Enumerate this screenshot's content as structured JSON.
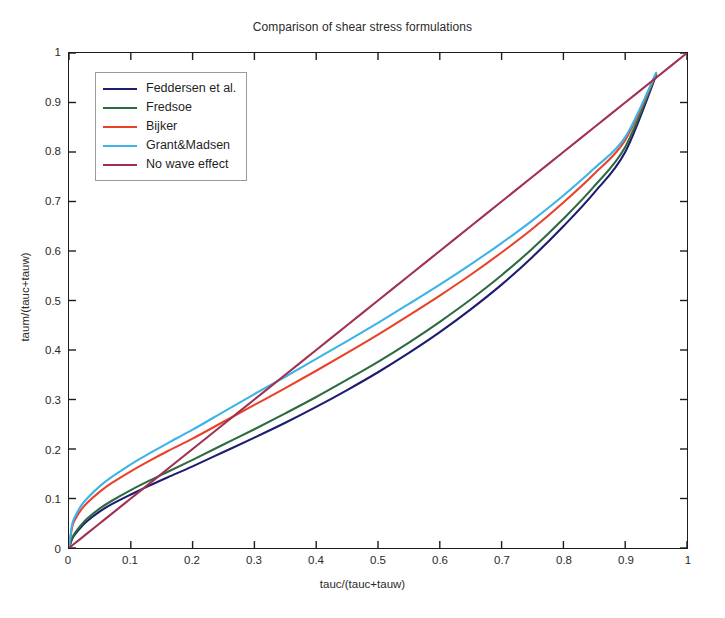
{
  "chart_data": {
    "type": "line",
    "title": "Comparison of shear stress formulations",
    "xlabel": "tauc/(tauc+tauw)",
    "ylabel": "taum/(tauc+tauw)",
    "xlim": [
      0,
      1
    ],
    "ylim": [
      0,
      1
    ],
    "grid": false,
    "legend_position": "upper left",
    "xticks": [
      "0",
      "0.1",
      "0.2",
      "0.3",
      "0.4",
      "0.5",
      "0.6",
      "0.7",
      "0.8",
      "0.9",
      "1"
    ],
    "xtick_values": [
      0,
      0.1,
      0.2,
      0.3,
      0.4,
      0.5,
      0.6,
      0.7,
      0.8,
      0.9,
      1
    ],
    "yticks": [
      "0",
      "0.1",
      "0.2",
      "0.3",
      "0.4",
      "0.5",
      "0.6",
      "0.7",
      "0.8",
      "0.9",
      "1"
    ],
    "ytick_values": [
      0,
      0.1,
      0.2,
      0.3,
      0.4,
      0.5,
      0.6,
      0.7,
      0.8,
      0.9,
      1
    ],
    "x": [
      0,
      0.005,
      0.01,
      0.02,
      0.03,
      0.05,
      0.07,
      0.1,
      0.13,
      0.16,
      0.2,
      0.25,
      0.3,
      0.35,
      0.4,
      0.45,
      0.5,
      0.55,
      0.6,
      0.65,
      0.7,
      0.75,
      0.8,
      0.85,
      0.9,
      0.95
    ],
    "series": [
      {
        "name": "Feddersen et al.",
        "color": "#1c1c72",
        "values": [
          0,
          0.018,
          0.028,
          0.043,
          0.055,
          0.074,
          0.089,
          0.108,
          0.126,
          0.143,
          0.165,
          0.194,
          0.223,
          0.253,
          0.285,
          0.319,
          0.355,
          0.394,
          0.436,
          0.482,
          0.532,
          0.588,
          0.65,
          0.718,
          0.8,
          0.955
        ]
      },
      {
        "name": "Fredsoe",
        "color": "#2d6b42",
        "values": [
          0,
          0.02,
          0.031,
          0.047,
          0.06,
          0.08,
          0.096,
          0.117,
          0.136,
          0.154,
          0.178,
          0.209,
          0.24,
          0.272,
          0.305,
          0.34,
          0.376,
          0.415,
          0.457,
          0.502,
          0.551,
          0.605,
          0.665,
          0.731,
          0.81,
          0.957
        ]
      },
      {
        "name": "Bijker",
        "color": "#e8432a",
        "values": [
          0,
          0.042,
          0.058,
          0.078,
          0.092,
          0.114,
          0.132,
          0.155,
          0.176,
          0.196,
          0.221,
          0.255,
          0.289,
          0.323,
          0.358,
          0.394,
          0.431,
          0.47,
          0.51,
          0.552,
          0.597,
          0.645,
          0.698,
          0.756,
          0.824,
          0.958
        ]
      },
      {
        "name": "Grant&Madsen",
        "color": "#3cb4e8",
        "values": [
          0,
          0.047,
          0.064,
          0.086,
          0.101,
          0.125,
          0.144,
          0.169,
          0.191,
          0.212,
          0.239,
          0.275,
          0.311,
          0.346,
          0.382,
          0.418,
          0.455,
          0.493,
          0.532,
          0.573,
          0.616,
          0.662,
          0.712,
          0.767,
          0.83,
          0.96
        ]
      },
      {
        "name": "No wave effect",
        "color": "#a03152",
        "values": [
          0,
          0.005,
          0.01,
          0.02,
          0.03,
          0.05,
          0.07,
          0.1,
          0.13,
          0.16,
          0.2,
          0.25,
          0.3,
          0.35,
          0.4,
          0.45,
          0.5,
          0.55,
          0.6,
          0.65,
          0.7,
          0.75,
          0.8,
          0.85,
          0.9,
          0.95
        ]
      }
    ],
    "extra_segments": [
      {
        "name": "No wave effect tail",
        "color": "#a03152",
        "x": [
          0.95,
          1.0
        ],
        "y": [
          0.95,
          1.0
        ]
      }
    ]
  },
  "legend": {
    "items": [
      {
        "label": "Feddersen et al.",
        "color": "#1c1c72"
      },
      {
        "label": "Fredsoe",
        "color": "#2d6b42"
      },
      {
        "label": "Bijker",
        "color": "#e8432a"
      },
      {
        "label": "Grant&Madsen",
        "color": "#3cb4e8"
      },
      {
        "label": "No wave effect",
        "color": "#a03152"
      }
    ]
  }
}
